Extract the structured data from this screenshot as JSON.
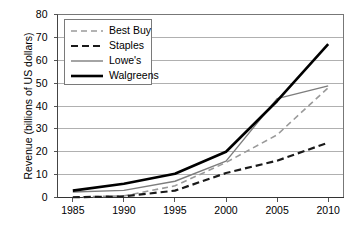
{
  "chart_data": {
    "type": "line",
    "title": "",
    "xlabel": "",
    "ylabel": "Revenue (billions of US dollars)",
    "x": [
      1985,
      1990,
      1995,
      2000,
      2005,
      2010
    ],
    "xlim": [
      1983.5,
      2011.5
    ],
    "ylim": [
      0,
      80
    ],
    "xticks": [
      "1985",
      "1990",
      "1995",
      "2000",
      "2005",
      "2010"
    ],
    "yticks": [
      "0",
      "10",
      "20",
      "30",
      "40",
      "50",
      "60",
      "70",
      "80"
    ],
    "grid": "horizontal",
    "legend_position": "top-left-inside",
    "series": [
      {
        "name": "Best Buy",
        "style": "dashed",
        "color": "#9a9a9a",
        "width": 1.6,
        "values": [
          0.2,
          0.7,
          5.1,
          15.3,
          27.4,
          48.0
        ]
      },
      {
        "name": "Staples",
        "style": "dashed",
        "color": "#1a1a1a",
        "width": 2.2,
        "values": [
          0.1,
          0.5,
          3.0,
          10.7,
          16.1,
          24.0
        ]
      },
      {
        "name": "Lowe's",
        "style": "solid",
        "color": "#7d7d7d",
        "width": 1.4,
        "values": [
          2.4,
          3.1,
          7.1,
          15.9,
          43.2,
          48.8
        ]
      },
      {
        "name": "Walgreens",
        "style": "solid",
        "color": "#000000",
        "width": 2.6,
        "values": [
          3.0,
          6.0,
          10.4,
          20.0,
          42.2,
          67.0
        ]
      }
    ]
  },
  "legend": {
    "items": [
      {
        "label": "Best Buy"
      },
      {
        "label": "Staples"
      },
      {
        "label": "Lowe's"
      },
      {
        "label": "Walgreens"
      }
    ]
  }
}
